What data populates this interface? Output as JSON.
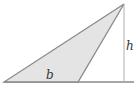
{
  "diagram": {
    "labels": {
      "base": "b",
      "height": "h"
    },
    "colors": {
      "fill": "#e4e4e4",
      "stroke": "#8a8a8a",
      "height_line": "#b0b0b0"
    }
  }
}
